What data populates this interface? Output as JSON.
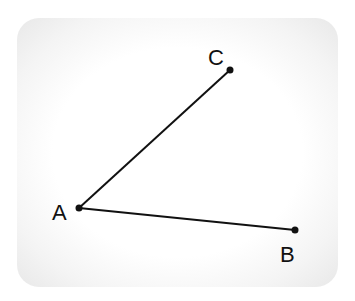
{
  "diagram": {
    "type": "angle",
    "points": [
      {
        "name": "A",
        "x": 79,
        "y": 208,
        "label_x": 52,
        "label_y": 220
      },
      {
        "name": "B",
        "x": 295,
        "y": 230,
        "label_x": 280,
        "label_y": 262
      },
      {
        "name": "C",
        "x": 230,
        "y": 70,
        "label_x": 208,
        "label_y": 65
      }
    ],
    "segments": [
      [
        "A",
        "C"
      ],
      [
        "A",
        "B"
      ]
    ],
    "colors": {
      "line": "#111111",
      "background": "#ffffff",
      "card_edge": "#e8e8e8"
    }
  }
}
